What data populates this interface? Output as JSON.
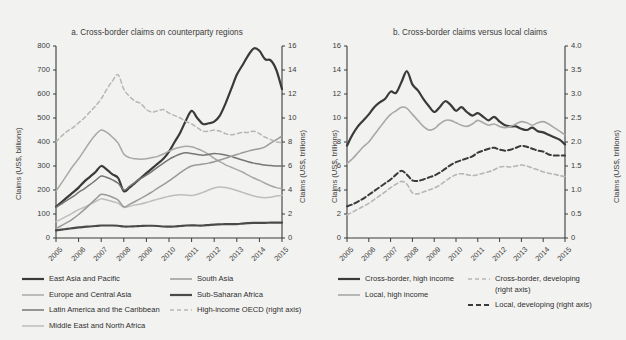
{
  "figure": {
    "background": "#f2f2f0",
    "ink": "#3b3b3b"
  },
  "panel_a": {
    "title": "a. Cross-border claims on counterparty regions",
    "left_axis_title": "Claims (US$, billions)",
    "right_axis_title": "Claims (US$, trillions)",
    "left_ticks": [
      "0",
      "100",
      "200",
      "300",
      "400",
      "500",
      "600",
      "700",
      "800"
    ],
    "right_ticks": [
      "0",
      "2",
      "4",
      "6",
      "8",
      "10",
      "12",
      "14",
      "16"
    ],
    "x_ticks": [
      "2005",
      "2006",
      "2007",
      "2008",
      "2009",
      "2010",
      "2011",
      "2012",
      "2013",
      "2014",
      "2015"
    ],
    "legend": [
      {
        "label": "East Asia and Pacific",
        "color": "#3a3a3a",
        "width": 2.2,
        "dash": "none"
      },
      {
        "label": "Europe and Central Asia",
        "color": "#a8a8a8",
        "width": 1.5,
        "dash": "none"
      },
      {
        "label": "Latin America and the Caribbean",
        "color": "#767676",
        "width": 1.5,
        "dash": "none"
      },
      {
        "label": "Middle East and North Africa",
        "color": "#bdbdbd",
        "width": 1.5,
        "dash": "none"
      },
      {
        "label": "South Asia",
        "color": "#9a9a9a",
        "width": 1.5,
        "dash": "none"
      },
      {
        "label": "Sub-Saharan Africa",
        "color": "#4a4a4a",
        "width": 2.2,
        "dash": "none"
      },
      {
        "label": "High-income OECD (right axis)",
        "color": "#b6b6b6",
        "width": 1.5,
        "dash": "4,3"
      }
    ]
  },
  "panel_b": {
    "title": "b. Cross-border claims versus local claims",
    "left_axis_title": "Claims (US$, trillions)",
    "right_axis_title": "Claims (US$, trillions)",
    "left_ticks": [
      "0",
      "2",
      "4",
      "6",
      "8",
      "10",
      "12",
      "14",
      "16"
    ],
    "right_ticks": [
      "0",
      "0.5",
      "1.0",
      "1.5",
      "2.0",
      "2.5",
      "3.0",
      "3.5",
      "4.0"
    ],
    "x_ticks": [
      "2005",
      "2006",
      "2007",
      "2008",
      "2009",
      "2010",
      "2011",
      "2012",
      "2013",
      "2014",
      "2015"
    ],
    "legend": [
      {
        "label": "Cross-border, high income",
        "color": "#3a3a3a",
        "width": 2.2,
        "dash": "none"
      },
      {
        "label": "Local, high income",
        "color": "#a8a8a8",
        "width": 1.6,
        "dash": "none"
      },
      {
        "label": "Cross-border, developing",
        "label2": "(right axis)",
        "color": "#b6b6b6",
        "width": 1.6,
        "dash": "4,3"
      },
      {
        "label": "Local, developing (right axis)",
        "color": "#3a3a3a",
        "width": 2.0,
        "dash": "5,3"
      }
    ]
  },
  "chart_data": [
    {
      "type": "line",
      "id": "panel_a",
      "title": "a. Cross-border claims on counterparty regions",
      "xlabel": "",
      "ylabel": "Claims (US$, billions)",
      "ylabel_right": "Claims (US$, trillions)",
      "xlim": [
        2005,
        2015
      ],
      "ylim": [
        0,
        800
      ],
      "ylim_right": [
        0,
        16
      ],
      "grid": false,
      "legend_position": "below",
      "x": [
        2005.0,
        2005.25,
        2005.5,
        2005.75,
        2006.0,
        2006.25,
        2006.5,
        2006.75,
        2007.0,
        2007.25,
        2007.5,
        2007.75,
        2008.0,
        2008.25,
        2008.5,
        2008.75,
        2009.0,
        2009.25,
        2009.5,
        2009.75,
        2010.0,
        2010.25,
        2010.5,
        2010.75,
        2011.0,
        2011.25,
        2011.5,
        2011.75,
        2012.0,
        2012.25,
        2012.5,
        2012.75,
        2013.0,
        2013.25,
        2013.5,
        2013.75,
        2014.0,
        2014.25,
        2014.5,
        2014.75,
        2015.0
      ],
      "series": [
        {
          "name": "East Asia and Pacific",
          "axis": "left",
          "color": "#3a3a3a",
          "values": [
            130,
            150,
            170,
            190,
            210,
            235,
            255,
            275,
            300,
            285,
            265,
            250,
            195,
            210,
            230,
            250,
            270,
            290,
            310,
            330,
            360,
            400,
            440,
            490,
            530,
            500,
            475,
            478,
            485,
            510,
            560,
            620,
            680,
            720,
            760,
            790,
            780,
            745,
            740,
            700,
            620
          ]
        },
        {
          "name": "Europe and Central Asia",
          "axis": "left",
          "color": "#a8a8a8",
          "values": [
            195,
            230,
            265,
            300,
            330,
            365,
            400,
            430,
            450,
            440,
            420,
            395,
            350,
            335,
            330,
            328,
            330,
            335,
            340,
            350,
            362,
            372,
            378,
            382,
            380,
            372,
            362,
            348,
            332,
            318,
            305,
            295,
            285,
            275,
            262,
            250,
            240,
            228,
            218,
            210,
            205
          ]
        },
        {
          "name": "Latin America and the Caribbean",
          "axis": "left",
          "color": "#767676",
          "values": [
            128,
            142,
            158,
            172,
            190,
            205,
            222,
            240,
            258,
            252,
            242,
            228,
            200,
            215,
            232,
            248,
            262,
            278,
            295,
            312,
            328,
            340,
            350,
            355,
            352,
            348,
            345,
            348,
            352,
            350,
            346,
            340,
            332,
            325,
            318,
            312,
            308,
            304,
            302,
            300,
            300
          ]
        },
        {
          "name": "Middle East and North Africa",
          "axis": "left",
          "color": "#bdbdbd",
          "values": [
            68,
            80,
            92,
            105,
            118,
            128,
            140,
            152,
            163,
            158,
            152,
            145,
            128,
            132,
            138,
            142,
            148,
            155,
            162,
            168,
            174,
            178,
            180,
            179,
            177,
            182,
            190,
            200,
            208,
            212,
            210,
            205,
            198,
            190,
            182,
            175,
            170,
            168,
            170,
            175,
            178
          ]
        },
        {
          "name": "South Asia",
          "axis": "left",
          "color": "#9a9a9a",
          "values": [
            40,
            52,
            65,
            80,
            98,
            118,
            140,
            162,
            182,
            178,
            170,
            158,
            130,
            140,
            152,
            165,
            178,
            192,
            208,
            222,
            238,
            255,
            272,
            288,
            300,
            305,
            308,
            312,
            318,
            325,
            332,
            340,
            348,
            355,
            362,
            368,
            372,
            380,
            395,
            410,
            425
          ]
        },
        {
          "name": "Sub-Saharan Africa",
          "axis": "left",
          "color": "#4a4a4a",
          "values": [
            32,
            35,
            38,
            41,
            44,
            46,
            48,
            50,
            52,
            52,
            52,
            51,
            48,
            48,
            49,
            50,
            51,
            51,
            50,
            48,
            47,
            48,
            50,
            52,
            53,
            52,
            52,
            54,
            56,
            57,
            58,
            58,
            58,
            60,
            62,
            63,
            63,
            63,
            64,
            64,
            64
          ]
        },
        {
          "name": "High-income OECD (right axis)",
          "axis": "right",
          "color": "#b6b6b6",
          "values_right": [
            8.0,
            8.5,
            8.9,
            9.2,
            9.6,
            10.0,
            10.5,
            11.0,
            11.6,
            12.4,
            13.1,
            13.6,
            12.4,
            11.8,
            11.4,
            11.2,
            10.7,
            10.5,
            10.6,
            10.7,
            10.4,
            10.2,
            10.0,
            9.7,
            9.5,
            9.2,
            8.9,
            8.9,
            9.0,
            8.9,
            8.7,
            8.6,
            8.7,
            8.8,
            8.8,
            8.9,
            8.7,
            8.4,
            8.2,
            8.0,
            7.95
          ]
        }
      ]
    },
    {
      "type": "line",
      "id": "panel_b",
      "title": "b. Cross-border claims versus local claims",
      "xlabel": "",
      "ylabel": "Claims (US$, trillions)",
      "ylabel_right": "Claims (US$, trillions)",
      "xlim": [
        2005,
        2015
      ],
      "ylim": [
        0,
        16
      ],
      "ylim_right": [
        0,
        4.0
      ],
      "grid": false,
      "legend_position": "below",
      "x": [
        2005.0,
        2005.25,
        2005.5,
        2005.75,
        2006.0,
        2006.25,
        2006.5,
        2006.75,
        2007.0,
        2007.25,
        2007.5,
        2007.75,
        2008.0,
        2008.25,
        2008.5,
        2008.75,
        2009.0,
        2009.25,
        2009.5,
        2009.75,
        2010.0,
        2010.25,
        2010.5,
        2010.75,
        2011.0,
        2011.25,
        2011.5,
        2011.75,
        2012.0,
        2012.25,
        2012.5,
        2012.75,
        2013.0,
        2013.25,
        2013.5,
        2013.75,
        2014.0,
        2014.25,
        2014.5,
        2014.75,
        2015.0
      ],
      "series": [
        {
          "name": "Cross-border, high income",
          "axis": "left",
          "color": "#3a3a3a",
          "values": [
            7.7,
            8.6,
            9.3,
            9.8,
            10.3,
            10.9,
            11.3,
            11.6,
            12.2,
            12.1,
            13.0,
            13.9,
            12.8,
            12.3,
            11.6,
            11.0,
            10.5,
            10.9,
            11.4,
            11.1,
            10.6,
            10.9,
            10.5,
            10.2,
            10.4,
            10.1,
            9.8,
            10.1,
            9.7,
            9.4,
            9.3,
            9.3,
            9.1,
            9.0,
            9.2,
            8.9,
            8.8,
            8.6,
            8.4,
            8.2,
            7.8
          ]
        },
        {
          "name": "Local, high income",
          "axis": "left",
          "color": "#a8a8a8",
          "values": [
            6.2,
            6.6,
            7.1,
            7.6,
            8.0,
            8.6,
            9.2,
            9.8,
            10.3,
            10.6,
            10.9,
            10.8,
            10.3,
            9.8,
            9.3,
            9.0,
            9.1,
            9.5,
            9.8,
            9.8,
            9.6,
            9.4,
            9.3,
            9.5,
            9.8,
            9.6,
            9.4,
            9.5,
            9.3,
            9.2,
            9.3,
            9.5,
            9.7,
            9.6,
            9.4,
            9.6,
            9.7,
            9.5,
            9.2,
            8.9,
            8.6
          ]
        },
        {
          "name": "Cross-border, developing (right axis)",
          "axis": "right",
          "color": "#b6b6b6",
          "values_right": [
            0.48,
            0.54,
            0.6,
            0.66,
            0.72,
            0.8,
            0.88,
            0.96,
            1.05,
            1.12,
            1.18,
            1.12,
            0.94,
            0.92,
            0.96,
            1.0,
            1.04,
            1.1,
            1.18,
            1.26,
            1.32,
            1.34,
            1.32,
            1.3,
            1.32,
            1.35,
            1.38,
            1.42,
            1.48,
            1.49,
            1.48,
            1.5,
            1.52,
            1.5,
            1.46,
            1.42,
            1.38,
            1.35,
            1.33,
            1.3,
            1.28
          ]
        },
        {
          "name": "Local, developing (right axis)",
          "axis": "right",
          "color": "#3a3a3a",
          "values_right": [
            0.66,
            0.7,
            0.76,
            0.82,
            0.9,
            0.98,
            1.06,
            1.14,
            1.22,
            1.32,
            1.4,
            1.32,
            1.2,
            1.19,
            1.22,
            1.26,
            1.3,
            1.36,
            1.44,
            1.52,
            1.58,
            1.62,
            1.66,
            1.7,
            1.78,
            1.82,
            1.86,
            1.88,
            1.84,
            1.82,
            1.84,
            1.88,
            1.92,
            1.9,
            1.86,
            1.82,
            1.8,
            1.74,
            1.72,
            1.72,
            1.72
          ]
        }
      ]
    }
  ]
}
